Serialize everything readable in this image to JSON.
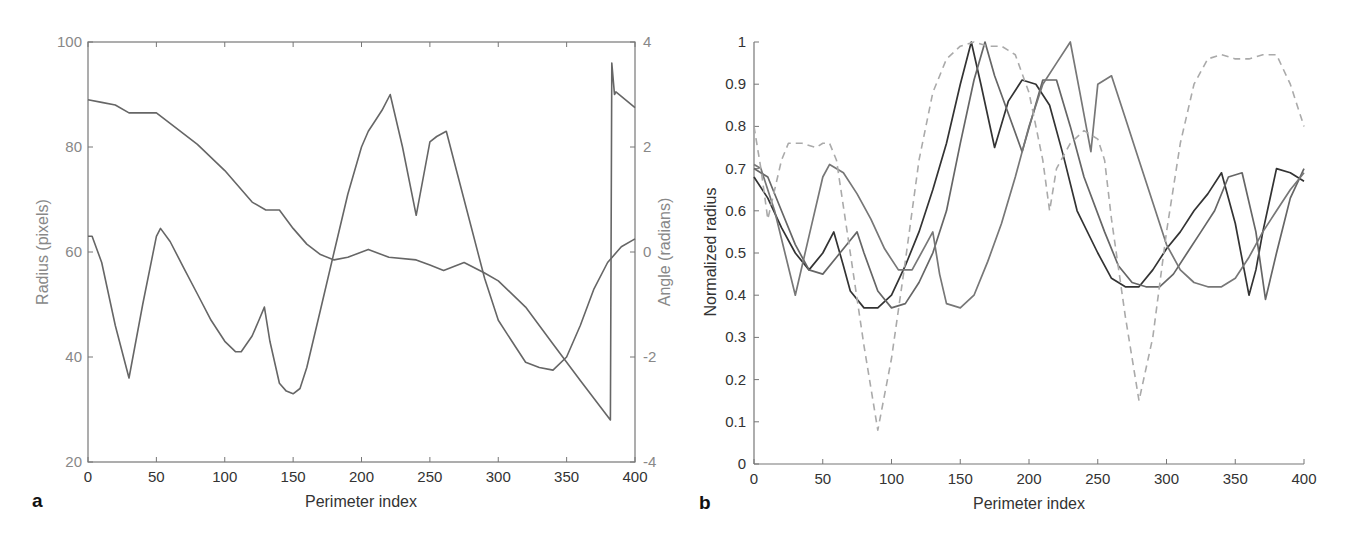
{
  "chart_data": [
    {
      "panel": "a",
      "type": "line",
      "xlabel": "Perimeter index",
      "ylabel": "Radius (pixels)",
      "ylabel_right": "Angle (radians)",
      "xlim": [
        0,
        400
      ],
      "ylim": [
        20,
        100
      ],
      "ylim_right": [
        -4,
        4
      ],
      "xticks": [
        0,
        50,
        100,
        150,
        200,
        250,
        300,
        350,
        400
      ],
      "yticks": [
        20,
        40,
        60,
        80,
        100
      ],
      "yticks_right": [
        -4,
        -2,
        0,
        2,
        4
      ],
      "grid": false,
      "legend": null,
      "series": [
        {
          "name": "Radius",
          "axis": "left",
          "style": "solid",
          "x": [
            0,
            3,
            10,
            20,
            30,
            40,
            50,
            53,
            60,
            70,
            80,
            90,
            100,
            108,
            112,
            120,
            125,
            129,
            133,
            140,
            145,
            150,
            155,
            160,
            170,
            180,
            190,
            200,
            205,
            210,
            215,
            221,
            230,
            240,
            250,
            255,
            262,
            270,
            280,
            290,
            300,
            310,
            320,
            330,
            340,
            350,
            360,
            370,
            380,
            390,
            400
          ],
          "y": [
            63,
            63,
            58,
            46,
            36,
            50,
            63,
            64.5,
            62,
            57,
            52,
            47,
            43,
            41,
            41,
            44,
            47,
            49.5,
            43,
            35,
            33.5,
            33,
            34,
            38,
            49,
            60,
            71,
            80,
            83,
            85,
            87,
            90,
            80,
            67,
            81,
            82,
            83,
            75,
            65,
            55,
            47,
            43,
            39,
            38,
            37.5,
            40,
            46,
            53,
            58,
            61,
            62.5
          ]
        },
        {
          "name": "Angle",
          "axis": "right",
          "style": "solid",
          "x": [
            0,
            10,
            20,
            30,
            50,
            60,
            80,
            100,
            120,
            130,
            140,
            150,
            160,
            170,
            180,
            190,
            205,
            220,
            240,
            250,
            260,
            275,
            290,
            300,
            320,
            340,
            360,
            382,
            383,
            385,
            386,
            400
          ],
          "y": [
            2.9,
            2.85,
            2.8,
            2.65,
            2.65,
            2.45,
            2.05,
            1.55,
            0.95,
            0.8,
            0.8,
            0.45,
            0.15,
            -0.05,
            -0.15,
            -0.1,
            0.05,
            -0.1,
            -0.15,
            -0.25,
            -0.35,
            -0.2,
            -0.4,
            -0.55,
            -1.05,
            -1.75,
            -2.45,
            -3.2,
            3.6,
            3.0,
            3.05,
            2.75
          ]
        }
      ]
    },
    {
      "panel": "b",
      "type": "line",
      "xlabel": "Perimeter index",
      "ylabel": "Normalized radius",
      "xlim": [
        0,
        400
      ],
      "ylim": [
        0,
        1
      ],
      "xticks": [
        0,
        50,
        100,
        150,
        200,
        250,
        300,
        350,
        400
      ],
      "yticks": [
        0,
        0.1,
        0.2,
        0.3,
        0.4,
        0.5,
        0.6,
        0.7,
        0.8,
        0.9,
        1
      ],
      "grid": false,
      "legend": null,
      "series": [
        {
          "name": "Shape 1 (dark)",
          "style": "solid",
          "color": "#333333",
          "x": [
            0,
            10,
            20,
            30,
            40,
            50,
            58,
            65,
            70,
            80,
            90,
            100,
            110,
            120,
            130,
            140,
            150,
            158,
            165,
            175,
            185,
            195,
            205,
            215,
            225,
            235,
            250,
            260,
            270,
            280,
            290,
            300,
            310,
            320,
            330,
            340,
            350,
            360,
            365,
            370,
            380,
            390,
            400
          ],
          "y": [
            0.68,
            0.63,
            0.56,
            0.5,
            0.46,
            0.5,
            0.55,
            0.47,
            0.41,
            0.37,
            0.37,
            0.4,
            0.47,
            0.55,
            0.65,
            0.76,
            0.9,
            1.0,
            0.9,
            0.75,
            0.86,
            0.91,
            0.9,
            0.85,
            0.73,
            0.6,
            0.5,
            0.44,
            0.42,
            0.42,
            0.46,
            0.51,
            0.55,
            0.6,
            0.64,
            0.69,
            0.57,
            0.4,
            0.46,
            0.55,
            0.7,
            0.69,
            0.67
          ]
        },
        {
          "name": "Shape 2",
          "style": "solid",
          "color": "#666666",
          "x": [
            0,
            10,
            20,
            30,
            40,
            50,
            60,
            70,
            75,
            80,
            90,
            100,
            110,
            120,
            130,
            140,
            150,
            160,
            168,
            175,
            185,
            195,
            210,
            220,
            230,
            240,
            255,
            265,
            275,
            285,
            295,
            305,
            315,
            325,
            335,
            345,
            355,
            365,
            372,
            380,
            390,
            400
          ],
          "y": [
            0.7,
            0.68,
            0.6,
            0.52,
            0.46,
            0.45,
            0.49,
            0.53,
            0.55,
            0.5,
            0.41,
            0.37,
            0.38,
            0.43,
            0.5,
            0.6,
            0.76,
            0.91,
            1.0,
            0.92,
            0.83,
            0.74,
            0.91,
            0.91,
            0.8,
            0.68,
            0.55,
            0.47,
            0.43,
            0.42,
            0.42,
            0.45,
            0.5,
            0.55,
            0.6,
            0.68,
            0.69,
            0.55,
            0.39,
            0.5,
            0.63,
            0.7
          ]
        },
        {
          "name": "Shape 3",
          "style": "solid",
          "color": "#777777",
          "x": [
            0,
            5,
            15,
            30,
            40,
            50,
            55,
            65,
            75,
            85,
            95,
            105,
            115,
            125,
            130,
            135,
            140,
            150,
            160,
            170,
            180,
            190,
            200,
            210,
            220,
            230,
            237,
            245,
            250,
            260,
            270,
            280,
            290,
            300,
            310,
            320,
            330,
            340,
            350,
            360,
            370,
            380,
            390,
            400
          ],
          "y": [
            0.71,
            0.7,
            0.6,
            0.4,
            0.54,
            0.68,
            0.71,
            0.69,
            0.64,
            0.58,
            0.51,
            0.46,
            0.46,
            0.52,
            0.55,
            0.45,
            0.38,
            0.37,
            0.4,
            0.48,
            0.57,
            0.68,
            0.8,
            0.9,
            0.95,
            1.0,
            0.88,
            0.74,
            0.9,
            0.92,
            0.82,
            0.72,
            0.62,
            0.52,
            0.46,
            0.43,
            0.42,
            0.42,
            0.44,
            0.49,
            0.55,
            0.6,
            0.65,
            0.69
          ]
        },
        {
          "name": "Shape 4 (reference, dashed)",
          "style": "dashed",
          "color": "#aaaaaa",
          "x": [
            0,
            5,
            10,
            20,
            25,
            35,
            45,
            50,
            55,
            60,
            70,
            80,
            90,
            100,
            110,
            120,
            130,
            140,
            150,
            160,
            170,
            180,
            185,
            190,
            200,
            210,
            215,
            220,
            230,
            240,
            250,
            255,
            260,
            270,
            280,
            290,
            300,
            310,
            320,
            330,
            340,
            350,
            360,
            370,
            380,
            390,
            400
          ],
          "y": [
            0.8,
            0.7,
            0.58,
            0.72,
            0.76,
            0.76,
            0.75,
            0.76,
            0.76,
            0.72,
            0.5,
            0.28,
            0.08,
            0.25,
            0.48,
            0.72,
            0.88,
            0.96,
            0.99,
            1.0,
            0.99,
            0.99,
            0.98,
            0.97,
            0.88,
            0.72,
            0.6,
            0.7,
            0.76,
            0.79,
            0.77,
            0.72,
            0.58,
            0.35,
            0.15,
            0.3,
            0.55,
            0.76,
            0.9,
            0.96,
            0.97,
            0.96,
            0.96,
            0.97,
            0.97,
            0.9,
            0.8
          ]
        }
      ]
    }
  ],
  "panels": {
    "a": {
      "letter": "a",
      "xlabel": "Perimeter index",
      "ylabel_left": "Radius (pixels)",
      "ylabel_right": "Angle (radians)",
      "xtick_labels": [
        "0",
        "50",
        "100",
        "150",
        "200",
        "250",
        "300",
        "350",
        "400"
      ],
      "ytick_labels_left": [
        "20",
        "40",
        "60",
        "80",
        "100"
      ],
      "ytick_labels_right": [
        "-4",
        "-2",
        "0",
        "2",
        "4"
      ]
    },
    "b": {
      "letter": "b",
      "xlabel": "Perimeter index",
      "ylabel": "Normalized radius",
      "xtick_labels": [
        "0",
        "50",
        "100",
        "150",
        "200",
        "250",
        "300",
        "350",
        "400"
      ],
      "ytick_labels": [
        "0",
        "0.1",
        "0.2",
        "0.3",
        "0.4",
        "0.5",
        "0.6",
        "0.7",
        "0.8",
        "0.9",
        "1"
      ]
    }
  },
  "colors": {
    "axis": "#777777",
    "panel_a_curve": "#666666",
    "panel_a_label": "#888888",
    "panel_b_label": "#333333",
    "dashed": "#aaaaaa"
  }
}
